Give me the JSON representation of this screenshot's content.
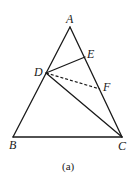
{
  "figure": {
    "type": "geometry-triangle",
    "caption": "(a)",
    "points": {
      "A": {
        "label": "A",
        "x": 70,
        "y": 27
      },
      "B": {
        "label": "B",
        "x": 13,
        "y": 137
      },
      "C": {
        "label": "C",
        "x": 122,
        "y": 137
      },
      "D": {
        "label": "D",
        "x": 46,
        "y": 73
      },
      "E": {
        "label": "E",
        "x": 85,
        "y": 57
      },
      "F": {
        "label": "F",
        "x": 100,
        "y": 89
      }
    },
    "segments": [
      {
        "from": "A",
        "to": "B",
        "style": "solid"
      },
      {
        "from": "B",
        "to": "C",
        "style": "solid"
      },
      {
        "from": "A",
        "to": "C",
        "style": "solid"
      },
      {
        "from": "D",
        "to": "E",
        "style": "solid"
      },
      {
        "from": "D",
        "to": "C",
        "style": "solid"
      },
      {
        "from": "D",
        "to": "F",
        "style": "dashed"
      }
    ],
    "colors": {
      "line": "#1a1a1a",
      "background": "#ffffff"
    }
  }
}
